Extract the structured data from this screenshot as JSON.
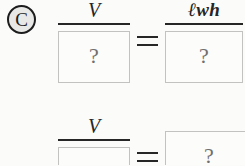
{
  "worksheet": {
    "part_label": "C",
    "background_color": "#fbfbfa",
    "ink_color": "#262626",
    "box_border_color": "#c2c2c0",
    "placeholder_color": "#6f6f6d",
    "equations": [
      {
        "id": "equation-1",
        "left": {
          "type": "fraction",
          "numerator": "V",
          "denominator": "?"
        },
        "operator": "=",
        "right": {
          "type": "fraction",
          "numerator": "ℓwh",
          "denominator": "?"
        }
      },
      {
        "id": "equation-2",
        "left": {
          "type": "fraction",
          "numerator": "V",
          "denominator": "?"
        },
        "operator": "=",
        "right": {
          "type": "box",
          "value": "?"
        }
      }
    ]
  }
}
